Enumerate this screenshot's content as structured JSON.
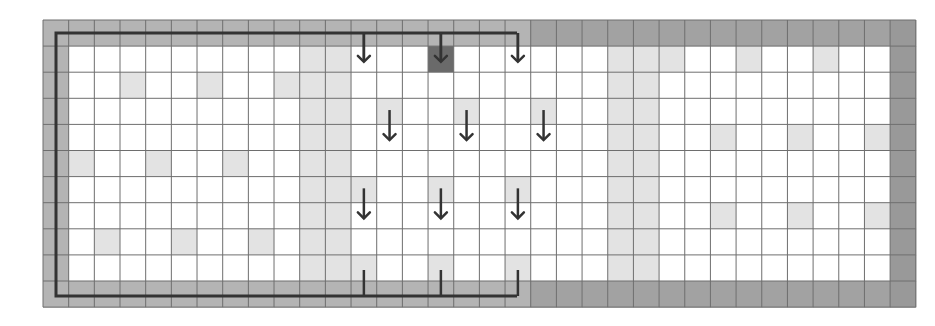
{
  "grid": {
    "origin_x": 43,
    "origin_y": 20,
    "cols": 33,
    "rows": 11,
    "cell_w": 25.67,
    "cell_h": 26.1,
    "colors": {
      "white": "#ffffff",
      "light": "#e3e3e3",
      "border_left_half": "#b4b4b4",
      "border_right_half": "#a2a2a2",
      "right_edge": "#999999",
      "dark_cell": "#6a6a6a",
      "grid_line": "#6e6e6e",
      "path_line": "#333333"
    },
    "light_full_columns": [
      10,
      11,
      22,
      23
    ],
    "light_cells": [
      [
        1,
        24
      ],
      [
        1,
        27
      ],
      [
        1,
        30
      ],
      [
        2,
        3
      ],
      [
        2,
        6
      ],
      [
        2,
        9
      ],
      [
        3,
        13
      ],
      [
        3,
        16
      ],
      [
        3,
        19
      ],
      [
        4,
        26
      ],
      [
        4,
        29
      ],
      [
        4,
        32
      ],
      [
        5,
        1
      ],
      [
        5,
        4
      ],
      [
        5,
        7
      ],
      [
        6,
        12
      ],
      [
        6,
        15
      ],
      [
        6,
        18
      ],
      [
        7,
        26
      ],
      [
        7,
        29
      ],
      [
        7,
        32
      ],
      [
        8,
        2
      ],
      [
        8,
        5
      ],
      [
        8,
        8
      ],
      [
        9,
        12
      ],
      [
        9,
        15
      ],
      [
        9,
        18
      ]
    ],
    "dark_cells": [
      [
        1,
        15
      ]
    ],
    "darker_border_from_col": 19
  },
  "arrows": [
    {
      "name": "down-arrow-r1-c12",
      "row": 1,
      "col": 12,
      "direction": "down",
      "glyph": "↓"
    },
    {
      "name": "down-arrow-r1-c15",
      "row": 1,
      "col": 15,
      "direction": "down",
      "glyph": "↓"
    },
    {
      "name": "down-arrow-r1-c18",
      "row": 1,
      "col": 18,
      "direction": "down",
      "glyph": "↓"
    },
    {
      "name": "down-arrow-r4-c13",
      "row": 4,
      "col": 13,
      "direction": "down",
      "glyph": "↓"
    },
    {
      "name": "down-arrow-r4-c16",
      "row": 4,
      "col": 16,
      "direction": "down",
      "glyph": "↓"
    },
    {
      "name": "down-arrow-r4-c19",
      "row": 4,
      "col": 19,
      "direction": "down",
      "glyph": "↓"
    },
    {
      "name": "down-arrow-r7-c12",
      "row": 7,
      "col": 12,
      "direction": "down",
      "glyph": "↓"
    },
    {
      "name": "down-arrow-r7-c15",
      "row": 7,
      "col": 15,
      "direction": "down",
      "glyph": "↓"
    },
    {
      "name": "down-arrow-r7-c18",
      "row": 7,
      "col": 18,
      "direction": "down",
      "glyph": "↓"
    }
  ],
  "bracket": {
    "left_x": 56,
    "top_y": 33,
    "bottom_y": 296,
    "right_x": 517,
    "top_tick_cols": [
      12,
      15,
      18
    ],
    "bottom_tick_cols": [
      12,
      15,
      18
    ],
    "bottom_tick_top_y": 270
  }
}
